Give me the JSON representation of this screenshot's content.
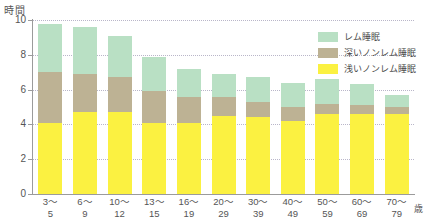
{
  "chart_data": {
    "type": "bar",
    "stacked": true,
    "title": "",
    "xlabel": "歳",
    "ylabel": "時間",
    "ylim": [
      0,
      10
    ],
    "yticks": [
      0,
      2,
      4,
      6,
      8,
      10
    ],
    "ytick_labels": [
      "0",
      "2",
      "4",
      "6",
      "8",
      "10"
    ],
    "grid": true,
    "legend_position": "top-right",
    "categories": [
      "3～5",
      "6～9",
      "10～12",
      "13～15",
      "16～19",
      "20～29",
      "30～39",
      "40～49",
      "50～59",
      "60～69",
      "70～79"
    ],
    "category_lines": [
      {
        "line1": "3～",
        "line2": "5"
      },
      {
        "line1": "6～",
        "line2": "9"
      },
      {
        "line1": "10～",
        "line2": "12"
      },
      {
        "line1": "13～",
        "line2": "15"
      },
      {
        "line1": "16～",
        "line2": "19"
      },
      {
        "line1": "20～",
        "line2": "29"
      },
      {
        "line1": "30～",
        "line2": "39"
      },
      {
        "line1": "40～",
        "line2": "49"
      },
      {
        "line1": "50～",
        "line2": "59"
      },
      {
        "line1": "60～",
        "line2": "69"
      },
      {
        "line1": "70～",
        "line2": "79"
      }
    ],
    "series": [
      {
        "name": "浅いノンレム睡眠",
        "color": "#fbf141",
        "values": [
          4.1,
          4.7,
          4.7,
          4.1,
          4.1,
          4.5,
          4.4,
          4.2,
          4.6,
          4.6,
          4.6
        ]
      },
      {
        "name": "深いノンレム睡眠",
        "color": "#bdb294",
        "values": [
          2.9,
          2.2,
          2.0,
          1.8,
          1.5,
          1.1,
          0.9,
          0.8,
          0.6,
          0.5,
          0.4
        ]
      },
      {
        "name": "レム睡眠",
        "color": "#b9e0c4",
        "values": [
          2.8,
          2.7,
          2.4,
          2.0,
          1.6,
          1.3,
          1.4,
          1.4,
          1.4,
          1.2,
          0.7
        ]
      }
    ],
    "totals": [
      9.8,
      9.6,
      9.1,
      7.9,
      7.2,
      6.9,
      6.7,
      6.4,
      6.6,
      6.3,
      5.7
    ]
  },
  "legend": {
    "items": [
      {
        "label": "レム睡眠",
        "color": "#b9e0c4"
      },
      {
        "label": "深いノンレム睡眠",
        "color": "#bdb294"
      },
      {
        "label": "浅いノンレム睡眠",
        "color": "#fbf141"
      }
    ]
  },
  "axes": {
    "y_unit": "時間",
    "x_unit": "歳"
  }
}
